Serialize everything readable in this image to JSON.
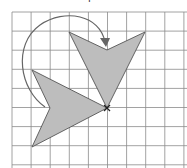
{
  "diagram": {
    "type": "rotation-on-grid",
    "caption_fragment": "ı",
    "grid": {
      "origin": [
        12,
        12
      ],
      "cell": 19.1,
      "cols": 9,
      "rows": 8,
      "line_color": "#8a8a8a"
    },
    "shapes": {
      "fill": "#bdbdbd",
      "stroke": "#555555",
      "original": [
        [
          32,
          70
        ],
        [
          107,
          108
        ],
        [
          32,
          147
        ],
        [
          50,
          108
        ]
      ],
      "rotated": [
        [
          69,
          32
        ],
        [
          107,
          50
        ],
        [
          145,
          32
        ],
        [
          107,
          108
        ]
      ]
    },
    "center_of_rotation": [
      107,
      108
    ],
    "arc": {
      "path": "M45,107 C20,90 12,45 40,25 C65,8 100,15 105,42",
      "color": "#666666"
    }
  }
}
